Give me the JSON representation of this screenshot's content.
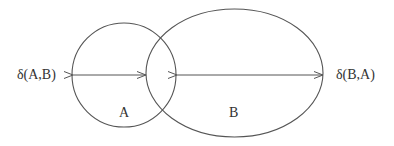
{
  "diagram": {
    "type": "set-distance-illustration",
    "colors": {
      "stroke": "#555555",
      "text": "#333333",
      "background": "#ffffff"
    },
    "shapes": [
      {
        "id": "A",
        "kind": "circle",
        "label": "A"
      },
      {
        "id": "B",
        "kind": "ellipse",
        "label": "B"
      }
    ],
    "arrows": [
      {
        "id": "delta_AB",
        "label": "δ(A,B)",
        "from": "left edge of A",
        "to": "left edge of B"
      },
      {
        "id": "delta_BA",
        "label": "δ(B,A)",
        "from": "right edge of A",
        "to": "right edge of B"
      }
    ]
  },
  "labels": {
    "set_a": "A",
    "set_b": "B",
    "delta_ab": "δ(A,B)",
    "delta_ba": "δ(B,A)"
  }
}
